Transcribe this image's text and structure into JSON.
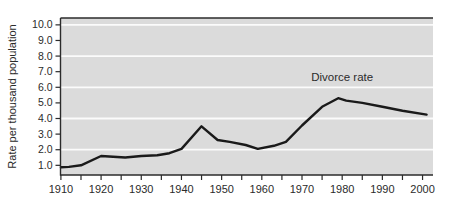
{
  "chart_data": {
    "type": "line",
    "title": "",
    "xlabel": "",
    "ylabel": "Rate per thousand population",
    "xlim": [
      1909.9,
      2002.6
    ],
    "ylim": [
      0.38,
      10.44
    ],
    "grid": "horizontal white gridlines on gray panel at even values",
    "legend_position": "none",
    "gridlines_y": [
      2,
      4,
      6,
      8,
      10
    ],
    "y_ticks": [
      {
        "value": 1,
        "label": "1.0"
      },
      {
        "value": 2,
        "label": "2.0"
      },
      {
        "value": 3,
        "label": "3.0"
      },
      {
        "value": 4,
        "label": "4.0"
      },
      {
        "value": 5,
        "label": "5.0"
      },
      {
        "value": 6,
        "label": "6.0"
      },
      {
        "value": 7,
        "label": "7.0"
      },
      {
        "value": 8,
        "label": "8.0"
      },
      {
        "value": 9,
        "label": "9.0"
      },
      {
        "value": 10,
        "label": "10.0"
      }
    ],
    "x_ticks": [
      {
        "value": 1910,
        "label": "1910"
      },
      {
        "value": 1920,
        "label": "1920"
      },
      {
        "value": 1930,
        "label": "1930"
      },
      {
        "value": 1940,
        "label": "1940"
      },
      {
        "value": 1950,
        "label": "1950"
      },
      {
        "value": 1960,
        "label": "1960"
      },
      {
        "value": 1970,
        "label": "1970"
      },
      {
        "value": 1980,
        "label": "1980"
      },
      {
        "value": 1990,
        "label": "1990"
      },
      {
        "value": 2000,
        "label": "2000"
      }
    ],
    "x_minor_tick_start": 1910,
    "x_minor_tick_end": 2000,
    "x_minor_tick_step": 5,
    "annotation": {
      "text": "Divorce rate",
      "x": 1980,
      "y": 6.6
    },
    "series": [
      {
        "name": "Divorce rate",
        "color": "#1a1a1a",
        "points": [
          [
            1910,
            0.88
          ],
          [
            1912,
            0.9
          ],
          [
            1915,
            1.0
          ],
          [
            1920,
            1.6
          ],
          [
            1923,
            1.55
          ],
          [
            1926,
            1.5
          ],
          [
            1930,
            1.6
          ],
          [
            1934,
            1.65
          ],
          [
            1937,
            1.78
          ],
          [
            1940,
            2.05
          ],
          [
            1945,
            3.5
          ],
          [
            1949,
            2.62
          ],
          [
            1952,
            2.5
          ],
          [
            1956,
            2.3
          ],
          [
            1959,
            2.05
          ],
          [
            1963,
            2.25
          ],
          [
            1966,
            2.5
          ],
          [
            1970,
            3.55
          ],
          [
            1975,
            4.75
          ],
          [
            1979,
            5.3
          ],
          [
            1981,
            5.15
          ],
          [
            1985,
            5.0
          ],
          [
            1990,
            4.75
          ],
          [
            1995,
            4.5
          ],
          [
            2001,
            4.25
          ]
        ]
      }
    ],
    "colors": {
      "page_bg": "#ffffff",
      "plot_bg": "#dbdbdb",
      "gridline": "#fbfbfb",
      "axis": "#2b2b2b",
      "line": "#1a1a1a",
      "text": "#2b2b2b"
    }
  }
}
